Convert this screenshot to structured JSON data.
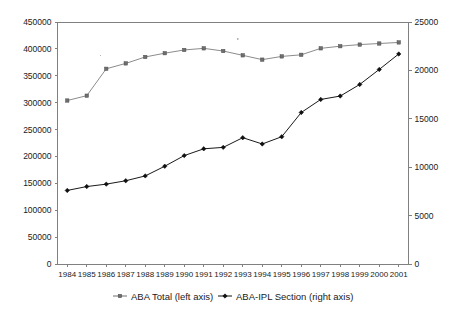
{
  "chart_data": {
    "type": "line",
    "title": "",
    "subtitle": "",
    "xlabel": "",
    "ylabel": "",
    "categories": [
      "1984",
      "1985",
      "1986",
      "1987",
      "1988",
      "1989",
      "1990",
      "1991",
      "1992",
      "1993",
      "1994",
      "1995",
      "1996",
      "1997",
      "1998",
      "1999",
      "2000",
      "2001"
    ],
    "grid": false,
    "legend_position": "bottom",
    "axes": {
      "left": {
        "label": "",
        "ylim": [
          0,
          450000
        ],
        "tick_step": 50000,
        "ticks": [
          "0",
          "50000",
          "100000",
          "150000",
          "200000",
          "250000",
          "300000",
          "350000",
          "400000",
          "450000"
        ]
      },
      "right": {
        "label": "",
        "ylim": [
          0,
          25000
        ],
        "tick_step": 5000,
        "ticks": [
          "0",
          "5000",
          "10000",
          "15000",
          "20000",
          "25000"
        ]
      },
      "x": {
        "ticks": [
          "1984",
          "1985",
          "1986",
          "1987",
          "1988",
          "1989",
          "1990",
          "1991",
          "1992",
          "1993",
          "1994",
          "1995",
          "1996",
          "1997",
          "1998",
          "1999",
          "2000",
          "2001"
        ]
      }
    },
    "series": [
      {
        "name": "ABA Total (left axis)",
        "axis": "left",
        "color": "#8c8c8c",
        "marker": "square",
        "values": [
          304000,
          313000,
          363000,
          373000,
          385000,
          392000,
          398000,
          401000,
          396000,
          388000,
          380000,
          386000,
          389000,
          401000,
          405000,
          408000,
          410000,
          412000
        ]
      },
      {
        "name": "ABA-IPL Section (right axis)",
        "axis": "right",
        "color": "#111111",
        "marker": "diamond",
        "values": [
          7600,
          8000,
          8250,
          8600,
          9100,
          10100,
          11200,
          11900,
          12050,
          13050,
          12400,
          13150,
          15650,
          17000,
          17350,
          18550,
          20100,
          21700
        ]
      }
    ],
    "legend": [
      {
        "label": "ABA Total (left axis)",
        "marker": "square",
        "color": "#6e6e6e"
      },
      {
        "label": "ABA-IPL Section (right axis)",
        "marker": "diamond",
        "color": "#111111"
      }
    ]
  }
}
